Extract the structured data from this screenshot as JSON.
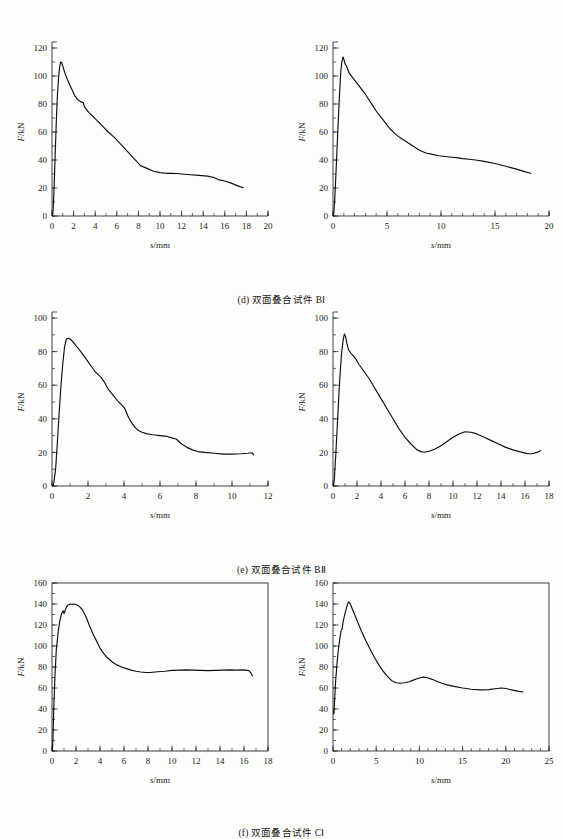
{
  "figure": {
    "axis_labels": {
      "x": "s/mm",
      "y": "F/kN",
      "y_italic": "F",
      "y_rest": "/kN",
      "x_italic": "s",
      "x_rest": "/mm"
    },
    "captions": {
      "d": "(d) 双面叠合试件 BⅠ",
      "e": "(e) 双面叠合试件 BⅡ",
      "f": "(f) 双面叠合试件 CⅠ"
    }
  },
  "chart_data": [
    {
      "id": "d-left",
      "type": "line",
      "title": "",
      "xlabel": "s/mm",
      "ylabel": "F/kN",
      "xlim": [
        0,
        20
      ],
      "ylim": [
        0,
        120
      ],
      "xticks": [
        0,
        2,
        4,
        6,
        8,
        10,
        12,
        14,
        16,
        18,
        20
      ],
      "yticks": [
        0,
        20,
        40,
        60,
        80,
        100,
        120
      ],
      "minor_x_step": 1,
      "minor_y_step": 10,
      "grid": false,
      "legend": "none",
      "frame": "L",
      "series": [
        {
          "name": "B I specimen 1",
          "x": [
            0.05,
            0.12,
            0.2,
            0.3,
            0.4,
            0.5,
            0.6,
            0.7,
            0.8,
            0.9,
            1.0,
            1.2,
            1.5,
            1.8,
            2.1,
            2.4,
            2.7,
            2.9,
            3.0,
            3.1,
            3.4,
            3.8,
            4.2,
            4.7,
            5.2,
            5.8,
            6.4,
            7.0,
            7.6,
            8.2,
            8.8,
            9.4,
            10.0,
            10.6,
            11.2,
            12.0,
            12.8,
            13.6,
            14.4,
            15.0,
            15.4,
            16.0,
            16.6,
            17.2,
            17.7
          ],
          "y": [
            0,
            6,
            22,
            45,
            68,
            86,
            98,
            106,
            110,
            109.5,
            107,
            102,
            96,
            91,
            86,
            83,
            81.5,
            81,
            78,
            77,
            74,
            71,
            68,
            64,
            60,
            56,
            51,
            46,
            41,
            36,
            34,
            32,
            31,
            30.5,
            30.5,
            30,
            29.5,
            29,
            28.5,
            27.5,
            26,
            25,
            23.5,
            21.5,
            20.2
          ]
        }
      ]
    },
    {
      "id": "d-right",
      "type": "line",
      "title": "",
      "xlabel": "s/mm",
      "ylabel": "F/kN",
      "xlim": [
        0,
        20
      ],
      "ylim": [
        0,
        120
      ],
      "xticks": [
        0,
        5,
        10,
        15,
        20
      ],
      "yticks": [
        0,
        20,
        40,
        60,
        80,
        100,
        120
      ],
      "minor_x_step": 1,
      "minor_y_step": 10,
      "grid": false,
      "legend": "none",
      "frame": "L",
      "series": [
        {
          "name": "B I specimen 2",
          "x": [
            0.05,
            0.15,
            0.3,
            0.45,
            0.6,
            0.72,
            0.82,
            0.9,
            0.95,
            1.0,
            1.1,
            1.25,
            1.5,
            1.8,
            2.1,
            2.5,
            3.0,
            3.5,
            4.0,
            4.4,
            4.8,
            5.2,
            5.7,
            6.2,
            6.8,
            7.4,
            8.0,
            8.6,
            9.2,
            9.8,
            10.4,
            11.0,
            11.6,
            12.0,
            12.6,
            13.2,
            14.0,
            15.0,
            16.0,
            17.0,
            17.8,
            18.3
          ],
          "y": [
            0,
            10,
            35,
            62,
            86,
            103,
            110,
            113,
            113.5,
            112,
            109,
            107,
            102,
            99,
            96,
            92,
            87,
            81,
            75,
            71,
            67,
            63,
            59,
            56,
            53,
            50,
            47,
            45,
            44,
            43,
            42.5,
            42,
            41.5,
            41,
            40.5,
            40,
            39,
            37.5,
            35.5,
            33.5,
            31.5,
            30.5,
            30.2
          ]
        }
      ]
    },
    {
      "id": "e-left",
      "type": "line",
      "title": "",
      "xlabel": "s/mm",
      "ylabel": "F/kN",
      "xlim": [
        0,
        12
      ],
      "ylim": [
        0,
        100
      ],
      "xticks": [
        0,
        2,
        4,
        6,
        8,
        10,
        12
      ],
      "yticks": [
        0,
        20,
        40,
        60,
        80,
        100
      ],
      "minor_x_step": 1,
      "minor_y_step": 10,
      "grid": false,
      "legend": "none",
      "frame": "L",
      "series": [
        {
          "name": "B II specimen 1",
          "x": [
            0.05,
            0.1,
            0.2,
            0.3,
            0.4,
            0.5,
            0.6,
            0.7,
            0.8,
            0.9,
            1.0,
            1.15,
            1.3,
            1.45,
            1.6,
            1.8,
            2.0,
            2.2,
            2.4,
            2.5,
            2.7,
            2.9,
            3.1,
            3.4,
            3.7,
            3.9,
            4.05,
            4.2,
            4.4,
            4.6,
            4.8,
            5.0,
            5.3,
            5.6,
            6.0,
            6.4,
            6.7,
            6.9,
            7.2,
            7.5,
            7.8,
            8.1,
            8.5,
            9.0,
            9.5,
            10.0,
            10.5,
            10.9,
            11.1,
            11.2
          ],
          "y": [
            0,
            2,
            10,
            26,
            44,
            60,
            73,
            83,
            87.5,
            88,
            87.5,
            86,
            84,
            82,
            80,
            77,
            74,
            71,
            68,
            67,
            65,
            62,
            58,
            54,
            50,
            48,
            46,
            42,
            38,
            35,
            33,
            32,
            31,
            30.5,
            30,
            29.5,
            28.5,
            28,
            25,
            23,
            21.5,
            20.5,
            20,
            19.5,
            19,
            19,
            19.2,
            19.5,
            19.8,
            18.6
          ]
        }
      ]
    },
    {
      "id": "e-right",
      "type": "line",
      "title": "",
      "xlabel": "s/mm",
      "ylabel": "F/kN",
      "xlim": [
        0,
        18
      ],
      "ylim": [
        0,
        100
      ],
      "xticks": [
        0,
        2,
        4,
        6,
        8,
        10,
        12,
        14,
        16,
        18
      ],
      "yticks": [
        0,
        20,
        40,
        60,
        80,
        100
      ],
      "minor_x_step": 1,
      "minor_y_step": 10,
      "grid": false,
      "legend": "none",
      "frame": "L",
      "series": [
        {
          "name": "B II specimen 2",
          "x": [
            0.05,
            0.12,
            0.25,
            0.4,
            0.55,
            0.7,
            0.85,
            0.95,
            1.05,
            1.15,
            1.3,
            1.5,
            1.7,
            1.9,
            2.2,
            2.6,
            3.0,
            3.5,
            4.0,
            4.5,
            5.0,
            5.5,
            6.0,
            6.5,
            7.0,
            7.4,
            7.7,
            8.0,
            8.5,
            9.0,
            9.5,
            10.0,
            10.5,
            11.0,
            11.5,
            12.0,
            12.6,
            13.2,
            13.8,
            14.4,
            15.0,
            15.6,
            16.2,
            16.6,
            17.0,
            17.3
          ],
          "y": [
            0,
            5,
            21,
            42,
            62,
            78,
            87,
            90.5,
            89,
            85,
            81,
            79,
            77.5,
            75.5,
            72,
            68,
            64,
            58,
            52,
            46,
            40,
            34,
            29,
            25,
            21.5,
            20.3,
            20.2,
            20.7,
            22,
            24,
            26.5,
            29,
            31,
            32.3,
            32,
            31,
            29,
            27,
            25,
            23,
            21.5,
            20.3,
            19.3,
            19.2,
            20,
            21
          ]
        }
      ]
    },
    {
      "id": "f-left",
      "type": "line",
      "title": "",
      "xlabel": "s/mm",
      "ylabel": "F/kN",
      "xlim": [
        0,
        18
      ],
      "ylim": [
        0,
        160
      ],
      "xticks": [
        0,
        2,
        4,
        6,
        8,
        10,
        12,
        14,
        16,
        18
      ],
      "yticks": [
        0,
        20,
        40,
        60,
        80,
        100,
        120,
        140,
        160
      ],
      "minor_x_step": 1,
      "minor_y_step": 10,
      "grid": false,
      "legend": "none",
      "frame": "box",
      "series": [
        {
          "name": "C I specimen 1",
          "x": [
            0.03,
            0.08,
            0.15,
            0.25,
            0.35,
            0.5,
            0.65,
            0.8,
            0.95,
            1.0,
            1.1,
            1.2,
            1.35,
            1.5,
            1.7,
            1.9,
            2.1,
            2.3,
            2.5,
            2.7,
            2.9,
            3.1,
            3.4,
            3.7,
            4.0,
            4.3,
            4.6,
            5.0,
            5.4,
            5.8,
            6.2,
            6.6,
            7.0,
            7.4,
            7.8,
            8.2,
            8.8,
            9.4,
            10.0,
            10.6,
            11.2,
            11.8,
            12.4,
            13.0,
            13.6,
            14.2,
            14.8,
            15.4,
            16.0,
            16.4,
            16.6,
            16.7
          ],
          "y": [
            0,
            12,
            42,
            72,
            95,
            112,
            124,
            131,
            133.5,
            131,
            134,
            137,
            139,
            139.8,
            140,
            139.8,
            139,
            137.5,
            135,
            131,
            126,
            120,
            112,
            105,
            98,
            93,
            89,
            85,
            82,
            80,
            78.5,
            77,
            76,
            75.2,
            74.8,
            74.8,
            75.5,
            76,
            76.8,
            77,
            77.2,
            77,
            76.8,
            76.5,
            76.8,
            77,
            77.2,
            77,
            77.2,
            76.5,
            74,
            71.5
          ]
        }
      ]
    },
    {
      "id": "f-right",
      "type": "line",
      "title": "",
      "xlabel": "s/mm",
      "ylabel": "F/kN",
      "xlim": [
        0,
        25
      ],
      "ylim": [
        0,
        160
      ],
      "xticks": [
        0,
        5,
        10,
        15,
        20,
        25
      ],
      "yticks": [
        0,
        20,
        40,
        60,
        80,
        100,
        120,
        140,
        160
      ],
      "minor_x_step": 1,
      "minor_y_step": 10,
      "grid": false,
      "legend": "none",
      "frame": "box",
      "series": [
        {
          "name": "C I specimen 2",
          "x": [
            0.05,
            0.1,
            0.18,
            0.3,
            0.45,
            0.6,
            0.8,
            0.95,
            1.05,
            1.15,
            1.25,
            1.4,
            1.55,
            1.7,
            1.8,
            1.9,
            2.0,
            2.2,
            2.5,
            2.9,
            3.3,
            3.8,
            4.3,
            4.8,
            5.3,
            5.8,
            6.3,
            6.8,
            7.3,
            7.8,
            8.3,
            8.8,
            9.3,
            9.8,
            10.2,
            10.5,
            10.9,
            11.4,
            12.0,
            12.6,
            13.2,
            14.0,
            15.0,
            16.0,
            17.0,
            18.0,
            19.0,
            19.5,
            20.0,
            20.8,
            21.5,
            22.0
          ],
          "y": [
            38,
            35,
            48,
            66,
            82,
            95,
            108,
            115,
            116,
            122,
            126,
            131,
            136,
            140,
            142,
            141.5,
            140,
            136,
            130,
            122,
            114,
            105,
            97,
            89,
            82,
            76,
            71,
            67,
            65,
            64.5,
            65,
            66,
            67.5,
            69,
            70,
            70.3,
            69.8,
            68.5,
            66.5,
            64.5,
            63,
            61.5,
            60,
            58.8,
            58.2,
            58.5,
            59.5,
            60,
            59.5,
            58,
            56.8,
            56.2
          ]
        }
      ]
    }
  ]
}
